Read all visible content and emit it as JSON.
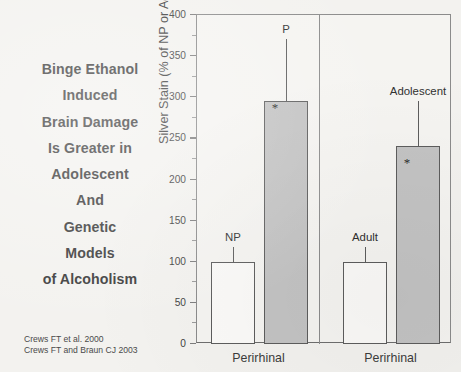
{
  "caption": {
    "lines": [
      "Binge Ethanol",
      "Induced",
      "Brain Damage",
      "Is Greater in",
      "Adolescent",
      "And",
      "Genetic",
      "Models",
      "of Alcoholism"
    ]
  },
  "citation": {
    "lines": [
      "Crews FT et al. 2000",
      "Crews FT and Braun CJ  2003"
    ]
  },
  "colors": {
    "bar_gray": "#c3c3c3",
    "bar_white": "#fbfaf8",
    "outline": "#5d5d5d",
    "axis": "#8b8b8b",
    "background": "#f3f2ef",
    "text": "#3c3c3c"
  },
  "chart_data": {
    "type": "bar",
    "title": "",
    "ylabel": "Silver Stain (% of NP or Adult)",
    "xlabel": "",
    "ylim": [
      0,
      400
    ],
    "yticks": [
      0,
      50,
      100,
      150,
      200,
      250,
      300,
      350,
      400
    ],
    "ytick_labels": [
      "0",
      "50",
      "100",
      "150",
      "200",
      "250",
      "300",
      "350",
      "400"
    ],
    "grid": false,
    "legend": "none",
    "panels": [
      {
        "name": "panel-left",
        "xlabel": "Perirhinal",
        "bars": [
          {
            "label": "NP",
            "value": 100,
            "error": 18,
            "fill": "white",
            "significant": false,
            "star": ""
          },
          {
            "label": "P",
            "value": 296,
            "error": 75,
            "fill": "gray",
            "significant": true,
            "star": "*"
          }
        ]
      },
      {
        "name": "panel-right",
        "xlabel": "Perirhinal",
        "bars": [
          {
            "label": "Adult",
            "value": 100,
            "error": 18,
            "fill": "white",
            "significant": false,
            "star": ""
          },
          {
            "label": "Adolescent",
            "value": 241,
            "error": 55,
            "fill": "gray",
            "significant": true,
            "star": "*"
          }
        ]
      }
    ]
  }
}
